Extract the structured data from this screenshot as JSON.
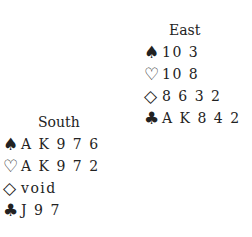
{
  "hands": {
    "east": {
      "title": "East",
      "suits": [
        {
          "icon": "spade-icon",
          "glyph": "♠",
          "cards": "10 3"
        },
        {
          "icon": "heart-icon",
          "glyph": "♡",
          "cards": "10 8"
        },
        {
          "icon": "diamond-icon",
          "glyph": "◇",
          "cards": "8 6 3 2"
        },
        {
          "icon": "club-icon",
          "glyph": "♣",
          "cards": "A K 8 4 2"
        }
      ]
    },
    "south": {
      "title": "South",
      "suits": [
        {
          "icon": "spade-icon",
          "glyph": "♠",
          "cards": "A K 9 7 6"
        },
        {
          "icon": "heart-icon",
          "glyph": "♡",
          "cards": "A K 9 7 2"
        },
        {
          "icon": "diamond-icon",
          "glyph": "◇",
          "cards": "void"
        },
        {
          "icon": "club-icon",
          "glyph": "♣",
          "cards": "J 9 7"
        }
      ]
    }
  }
}
